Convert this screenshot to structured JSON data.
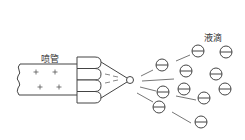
{
  "diagram": {
    "labels": {
      "nozzle": "喷管",
      "droplets": "液滴"
    },
    "colors": {
      "stroke": "#444444",
      "line": "#777777",
      "background": "#ffffff"
    },
    "tube": {
      "x": 17,
      "y": 64,
      "w": 60,
      "h": 31,
      "charge": "+"
    },
    "plus_signs": [
      {
        "x": 36,
        "y": 72
      },
      {
        "x": 55,
        "y": 72
      },
      {
        "x": 40,
        "y": 87
      },
      {
        "x": 59,
        "y": 87
      }
    ],
    "nozzle_segments": 4,
    "tip": {
      "x": 130,
      "y": 80,
      "r": 3.5
    },
    "droplet_charge": "−",
    "droplets": [
      {
        "x": 162,
        "y": 65
      },
      {
        "x": 198,
        "y": 51
      },
      {
        "x": 226,
        "y": 52
      },
      {
        "x": 186,
        "y": 71
      },
      {
        "x": 216,
        "y": 74
      },
      {
        "x": 184,
        "y": 89
      },
      {
        "x": 163,
        "y": 92
      },
      {
        "x": 225,
        "y": 89
      },
      {
        "x": 204,
        "y": 98
      },
      {
        "x": 159,
        "y": 107
      },
      {
        "x": 201,
        "y": 122
      }
    ],
    "trails": [
      {
        "x1": 141,
        "y1": 76,
        "x2": 153,
        "y2": 70
      },
      {
        "x1": 176,
        "y1": 61,
        "x2": 190,
        "y2": 55
      },
      {
        "x1": 142,
        "y1": 81,
        "x2": 174,
        "y2": 79
      },
      {
        "x1": 140,
        "y1": 87,
        "x2": 156,
        "y2": 91
      },
      {
        "x1": 176,
        "y1": 96,
        "x2": 196,
        "y2": 100
      },
      {
        "x1": 137,
        "y1": 93,
        "x2": 153,
        "y2": 102
      },
      {
        "x1": 172,
        "y1": 112,
        "x2": 191,
        "y2": 123
      }
    ]
  }
}
